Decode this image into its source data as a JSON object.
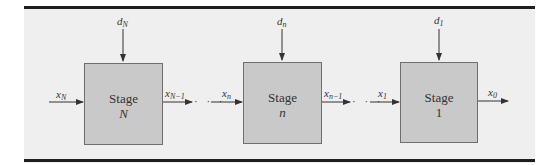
{
  "diagram": {
    "type": "multistage-serial-system",
    "stages": [
      {
        "title": "Stage",
        "index": "N",
        "decision": {
          "base": "d",
          "sub": "N"
        },
        "input": {
          "base": "x",
          "sub": "N"
        },
        "output": {
          "base": "x",
          "sub": "N−1"
        }
      },
      {
        "title": "Stage",
        "index": "n",
        "decision": {
          "base": "d",
          "sub": "n"
        },
        "input": {
          "base": "x",
          "sub": "n"
        },
        "output": {
          "base": "x",
          "sub": "n−1"
        }
      },
      {
        "title": "Stage",
        "index": "1",
        "decision": {
          "base": "d",
          "sub": "1"
        },
        "input": {
          "base": "x",
          "sub": "1"
        },
        "output": {
          "base": "x",
          "sub": "0"
        }
      }
    ],
    "ellipsis": "· · ·",
    "colors": {
      "panel_background": "#efefef",
      "stage_fill": "#c9c9c9",
      "stage_border": "#6f6f6f",
      "rule": "#1e1e1e",
      "arrow": "#333333"
    }
  }
}
